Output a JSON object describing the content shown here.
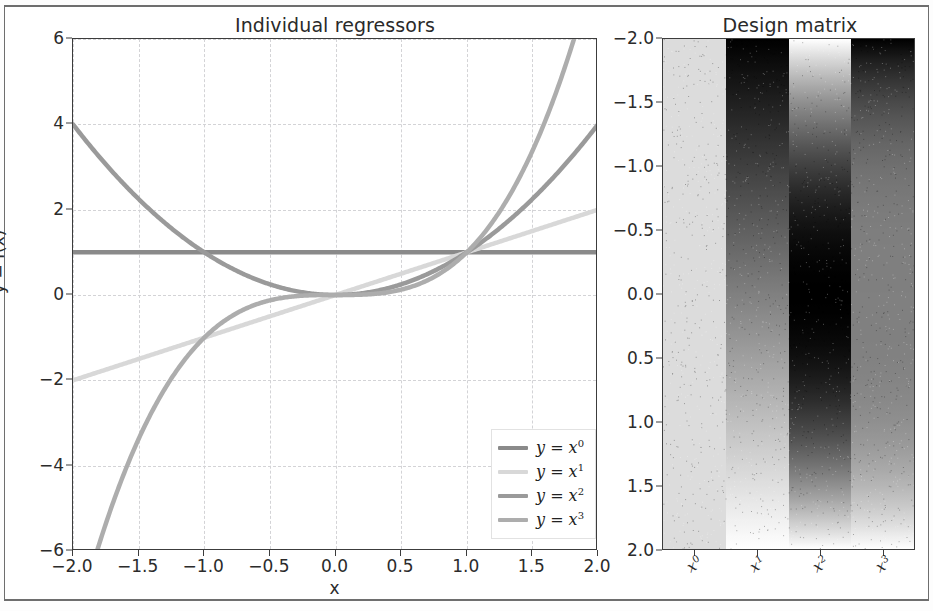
{
  "figure": {
    "background": "#ffffff",
    "frame_color": "#6e6e6e"
  },
  "left_panel": {
    "title": "Individual regressors",
    "xlabel": "x",
    "ylabel": "y = f(x)",
    "xticks": [
      "-2.0",
      "-1.5",
      "-1.0",
      "-0.5",
      "0.0",
      "0.5",
      "1.0",
      "1.5",
      "2.0"
    ],
    "yticks": [
      "6",
      "4",
      "2",
      "0",
      "-2",
      "-4",
      "-6"
    ],
    "legend": {
      "items": [
        {
          "label": "y = x",
          "power": "0",
          "color": "#8a8a8a"
        },
        {
          "label": "y = x",
          "power": "1",
          "color": "#d8d8d8"
        },
        {
          "label": "y = x",
          "power": "2",
          "color": "#9a9a9a"
        },
        {
          "label": "y = x",
          "power": "3",
          "color": "#adadad"
        }
      ]
    }
  },
  "right_panel": {
    "title": "Design matrix",
    "yticks": [
      "-2.0",
      "-1.5",
      "-1.0",
      "-0.5",
      "0.0",
      "0.5",
      "1.0",
      "1.5",
      "2.0"
    ],
    "xticks": [
      {
        "base": "x",
        "power": "0"
      },
      {
        "base": "x",
        "power": "1"
      },
      {
        "base": "x",
        "power": "2"
      },
      {
        "base": "x",
        "power": "3"
      }
    ]
  },
  "chart_data": [
    {
      "type": "line",
      "title": "Individual regressors",
      "xlabel": "x",
      "ylabel": "y = f(x)",
      "xlim": [
        -2.0,
        2.0
      ],
      "ylim": [
        -6,
        6
      ],
      "xticks": [
        -2.0,
        -1.5,
        -1.0,
        -0.5,
        0.0,
        0.5,
        1.0,
        1.5,
        2.0
      ],
      "yticks": [
        -6,
        -4,
        -2,
        0,
        2,
        4,
        6
      ],
      "grid": true,
      "legend_position": "lower right",
      "colormap": "grayscale",
      "series": [
        {
          "name": "y = x^0",
          "color": "#8a8a8a",
          "x": [
            -2.0,
            -1.5,
            -1.0,
            -0.5,
            0.0,
            0.5,
            1.0,
            1.5,
            2.0
          ],
          "values": [
            1,
            1,
            1,
            1,
            1,
            1,
            1,
            1,
            1
          ]
        },
        {
          "name": "y = x^1",
          "color": "#d8d8d8",
          "x": [
            -2.0,
            -1.5,
            -1.0,
            -0.5,
            0.0,
            0.5,
            1.0,
            1.5,
            2.0
          ],
          "values": [
            -2.0,
            -1.5,
            -1.0,
            -0.5,
            0.0,
            0.5,
            1.0,
            1.5,
            2.0
          ]
        },
        {
          "name": "y = x^2",
          "color": "#9a9a9a",
          "x": [
            -2.0,
            -1.5,
            -1.0,
            -0.5,
            0.0,
            0.5,
            1.0,
            1.5,
            2.0
          ],
          "values": [
            4.0,
            2.25,
            1.0,
            0.25,
            0.0,
            0.25,
            1.0,
            2.25,
            4.0
          ]
        },
        {
          "name": "y = x^3",
          "color": "#adadad",
          "x": [
            -2.0,
            -1.5,
            -1.0,
            -0.5,
            0.0,
            0.5,
            1.0,
            1.5,
            2.0
          ],
          "values": [
            -8.0,
            -3.375,
            -1.0,
            -0.125,
            0.0,
            0.125,
            1.0,
            3.375,
            8.0
          ]
        }
      ]
    },
    {
      "type": "heatmap",
      "title": "Design matrix",
      "xlabel": "",
      "ylabel": "",
      "columns": [
        "x^0",
        "x^1",
        "x^2",
        "x^3"
      ],
      "row_axis_range": [
        -2.0,
        2.0
      ],
      "row_ticks": [
        -2.0,
        -1.5,
        -1.0,
        -0.5,
        0.0,
        0.5,
        1.0,
        1.5,
        2.0
      ],
      "colormap": "gray",
      "note": "each column c holds x**c for x from -2 to 2 top-to-bottom; shading normalized per column",
      "column_value_ranges": [
        {
          "column": "x^0",
          "min": 1.0,
          "max": 1.0
        },
        {
          "column": "x^1",
          "min": -2.0,
          "max": 2.0
        },
        {
          "column": "x^2",
          "min": 0.0,
          "max": 4.0
        },
        {
          "column": "x^3",
          "min": -8.0,
          "max": 8.0
        }
      ]
    }
  ]
}
